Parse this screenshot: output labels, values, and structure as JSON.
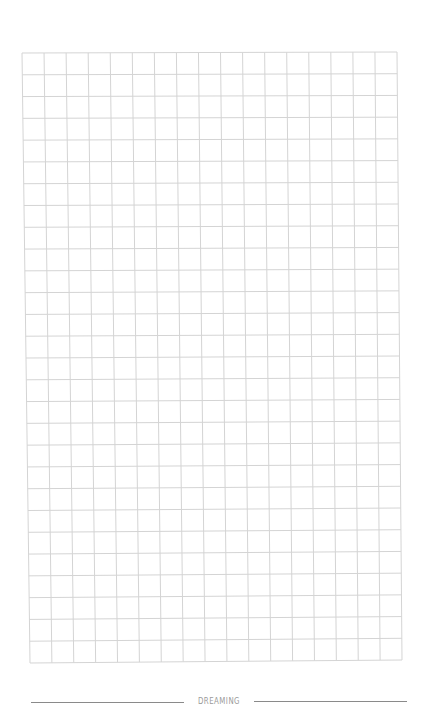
{
  "page": {
    "type": "grid-notebook-page",
    "background_color": "#ffffff"
  },
  "grid": {
    "columns": 17,
    "rows": 28,
    "line_color": "#d4d4d4",
    "corners": {
      "top_left": [
        22,
        53
      ],
      "top_right": [
        397,
        52
      ],
      "bottom_left": [
        30,
        663
      ],
      "bottom_right": [
        402,
        660
      ]
    }
  },
  "footer": {
    "label": "DREAMING",
    "text_color": "#9a9a9a",
    "line_color": "#8a8a8a"
  }
}
